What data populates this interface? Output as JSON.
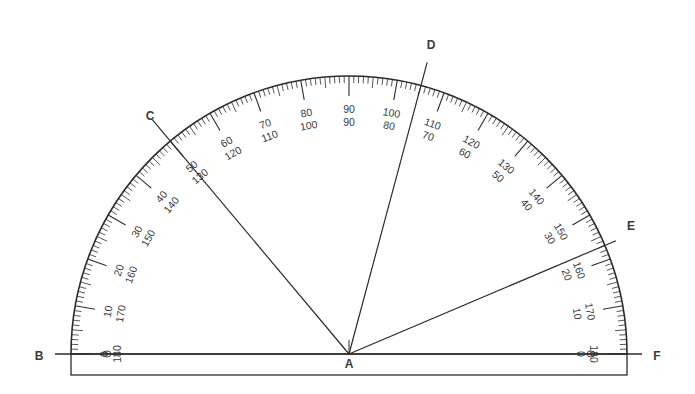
{
  "diagram": {
    "type": "protractor-angle-measurement",
    "center": {
      "x": 349,
      "y": 354
    },
    "outer_radius": 278,
    "base_rect": {
      "left": 71,
      "right": 627,
      "top": 354,
      "bottom": 375
    },
    "colors": {
      "stroke": "#2b2b2b",
      "text": "#3a3a3a",
      "background": "#ffffff"
    },
    "scale": {
      "min": 0,
      "max": 180,
      "major_step": 10,
      "minor_step": 1,
      "outer_labels": [
        "0",
        "10",
        "20",
        "30",
        "40",
        "50",
        "60",
        "70",
        "80",
        "90",
        "100",
        "110",
        "120",
        "130",
        "140",
        "150",
        "160",
        "170",
        "180"
      ],
      "inner_labels": [
        "180",
        "170",
        "160",
        "150",
        "140",
        "130",
        "120",
        "110",
        "100",
        "90",
        "80",
        "70",
        "60",
        "50",
        "40",
        "30",
        "20",
        "10",
        "0"
      ]
    },
    "points": [
      {
        "id": "A",
        "label": "A",
        "x": 349,
        "y": 368,
        "role": "vertex"
      },
      {
        "id": "B",
        "label": "B",
        "x": 39,
        "y": 360
      },
      {
        "id": "C",
        "label": "C",
        "x": 150,
        "y": 120
      },
      {
        "id": "D",
        "label": "D",
        "x": 431,
        "y": 49
      },
      {
        "id": "E",
        "label": "E",
        "x": 631,
        "y": 230
      },
      {
        "id": "F",
        "label": "F",
        "x": 657,
        "y": 360
      }
    ],
    "rays": [
      {
        "name": "ray-AC",
        "to": "C",
        "angle_deg": 130,
        "length": 306
      },
      {
        "name": "ray-AD",
        "to": "D",
        "angle_deg": 75,
        "length": 302
      },
      {
        "name": "ray-AE",
        "to": "E",
        "angle_deg": 23,
        "length": 290
      }
    ],
    "baseline": {
      "name": "line-BF",
      "x1": 55,
      "x2": 642,
      "y": 354
    }
  }
}
